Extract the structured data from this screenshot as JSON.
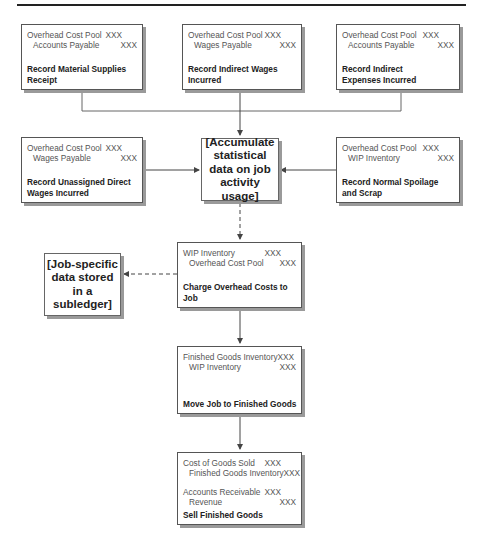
{
  "diagram": {
    "title_rule": true,
    "boxes": {
      "material_supplies": {
        "entries": [
          {
            "account": "Overhead Cost Pool",
            "amount": "XXX",
            "side": "debit"
          },
          {
            "account": "Accounts Payable",
            "amount": "XXX",
            "side": "credit"
          }
        ],
        "caption": "Record Material Supplies Receipt"
      },
      "indirect_wages": {
        "entries": [
          {
            "account": "Overhead Cost Pool",
            "amount": "XXX",
            "side": "debit"
          },
          {
            "account": "Wages Payable",
            "amount": "XXX",
            "side": "credit"
          }
        ],
        "caption": "Record Indirect Wages Incurred"
      },
      "indirect_expenses": {
        "entries": [
          {
            "account": "Overhead Cost Pool",
            "amount": "XXX",
            "side": "debit"
          },
          {
            "account": "Accounts Payable",
            "amount": "XXX",
            "side": "credit"
          }
        ],
        "caption": "Record Indirect Expenses Incurred"
      },
      "unassigned_direct_wages": {
        "entries": [
          {
            "account": "Overhead Cost Pool",
            "amount": "XXX",
            "side": "debit"
          },
          {
            "account": "Wages Payable",
            "amount": "XXX",
            "side": "credit"
          }
        ],
        "caption": "Record Unassigned Direct Wages Incurred"
      },
      "normal_spoilage": {
        "entries": [
          {
            "account": "Overhead Cost Pool",
            "amount": "XXX",
            "side": "debit"
          },
          {
            "account": "WIP Inventory",
            "amount": "XXX",
            "side": "credit"
          }
        ],
        "caption": "Record Normal Spoilage and Scrap"
      },
      "charge_overhead": {
        "entries": [
          {
            "account": "WIP Inventory",
            "amount": "XXX",
            "side": "debit"
          },
          {
            "account": "Overhead Cost Pool",
            "amount": "XXX",
            "side": "credit"
          }
        ],
        "caption": "Charge Overhead Costs to Job"
      },
      "move_job": {
        "entries": [
          {
            "account": "Finished Goods Inventory",
            "amount": "XXX",
            "side": "debit"
          },
          {
            "account": "WIP Inventory",
            "amount": "XXX",
            "side": "credit"
          }
        ],
        "caption": "Move Job to Finished Goods"
      },
      "sell_goods": {
        "entries": [
          {
            "account": "Cost of Goods Sold",
            "amount": "XXX",
            "side": "debit"
          },
          {
            "account": "Finished Goods Inventory",
            "amount": "XXX",
            "side": "credit"
          },
          {
            "account": "Accounts Receivable",
            "amount": "XXX",
            "side": "debit"
          },
          {
            "account": "Revenue",
            "amount": "XXX",
            "side": "credit"
          }
        ],
        "caption": "Sell Finished Goods"
      }
    },
    "notes": {
      "accumulate": "[Accumulate statistical data on job activity usage]",
      "job_specific": "[Job-specific data stored in a subledger]"
    },
    "colors": {
      "line": "#444444",
      "box_border": "#555555",
      "shadow": "#9a9a9a"
    }
  }
}
